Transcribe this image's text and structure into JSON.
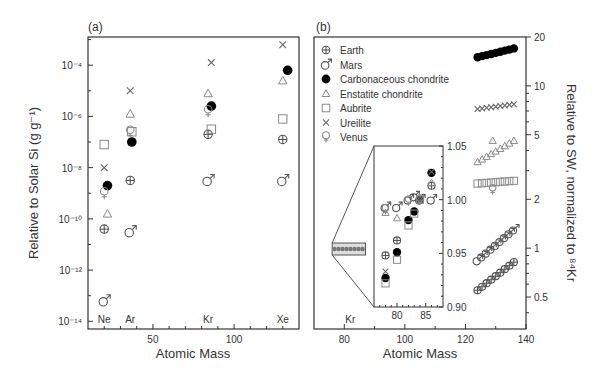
{
  "figure": {
    "panel_a_label": "(a)",
    "panel_b_label": "(b)"
  },
  "chart_data": [
    {
      "type": "scatter",
      "panel": "(a)",
      "title": "",
      "xlabel": "Atomic Mass",
      "ylabel": "Relative to Solar Si (g g⁻¹)",
      "xlim": [
        10,
        140
      ],
      "ylim_log10": [
        -14.3,
        -2.9
      ],
      "yscale": "log",
      "x_ticks": [
        50,
        100
      ],
      "y_ticks": [
        "10⁻¹⁴",
        "10⁻¹²",
        "10⁻¹⁰",
        "10⁻⁸",
        "10⁻⁶",
        "10⁻⁴"
      ],
      "element_labels": [
        {
          "text": "Ne",
          "x": 20
        },
        {
          "text": "Ar",
          "x": 36
        },
        {
          "text": "Kr",
          "x": 84
        },
        {
          "text": "Xe",
          "x": 130
        }
      ],
      "grid": false,
      "series": [
        {
          "name": "Earth",
          "marker": "earth",
          "points": [
            [
              20,
              -10.4
            ],
            [
              36,
              -8.5
            ],
            [
              84,
              -6.7
            ],
            [
              130,
              -6.9
            ]
          ]
        },
        {
          "name": "Mars",
          "marker": "mars",
          "points": [
            [
              20,
              -13.2
            ],
            [
              36,
              -10.5
            ],
            [
              84,
              -8.5
            ],
            [
              130,
              -8.5
            ]
          ]
        },
        {
          "name": "Carbonaceous chondrite",
          "marker": "filled-circle",
          "points": [
            [
              22,
              -8.7
            ],
            [
              37,
              -7.0
            ],
            [
              86,
              -5.6
            ],
            [
              133,
              -4.2
            ]
          ]
        },
        {
          "name": "Enstatite chondrite",
          "marker": "triangle",
          "points": [
            [
              22,
              -9.8
            ],
            [
              36,
              -5.9
            ],
            [
              84,
              -5.1
            ],
            [
              130,
              -4.6
            ]
          ]
        },
        {
          "name": "Aubrite",
          "marker": "square",
          "points": [
            [
              20,
              -7.1
            ],
            [
              37,
              -6.6
            ],
            [
              86,
              -6.5
            ],
            [
              130,
              -6.1
            ]
          ]
        },
        {
          "name": "Ureilite",
          "marker": "cross",
          "points": [
            [
              20,
              -8.0
            ],
            [
              36,
              -5.0
            ],
            [
              86,
              -3.9
            ],
            [
              130,
              -3.2
            ]
          ]
        },
        {
          "name": "Venus",
          "marker": "venus",
          "points": [
            [
              20,
              -9.0
            ],
            [
              36,
              -6.6
            ],
            [
              84,
              -5.8
            ]
          ]
        }
      ]
    },
    {
      "type": "scatter",
      "panel": "(b)",
      "title": "",
      "xlabel": "Atomic Mass",
      "ylabel": "Relative to SW, normalized to ⁸⁴Kr",
      "ylabel_position": "right",
      "xlim": [
        70,
        140
      ],
      "ylim": [
        0.3,
        20
      ],
      "yscale": "log",
      "x_ticks": [
        80,
        100,
        120,
        140
      ],
      "y_ticks": [
        0.5,
        1,
        2,
        5,
        10,
        20
      ],
      "element_labels": [
        {
          "text": "Kr",
          "x": 82
        }
      ],
      "grid": false,
      "legend": {
        "position": "upper left",
        "entries": [
          "Earth",
          "Mars",
          "Carbonaceous chondrite",
          "Enstatite chondrite",
          "Aubrite",
          "Ureilite",
          "Venus"
        ]
      },
      "series": [
        {
          "name": "Earth",
          "marker": "earth",
          "x_range": [
            124,
            136
          ],
          "y_range": [
            0.55,
            0.82
          ],
          "note": "Xe isotopes, rising trend"
        },
        {
          "name": "Mars",
          "marker": "mars",
          "x_range": [
            124,
            136
          ],
          "y_range": [
            0.84,
            1.3
          ],
          "note": "Xe isotopes, rising trend"
        },
        {
          "name": "Carbonaceous chondrite",
          "marker": "filled-circle",
          "x_range": [
            124,
            136
          ],
          "y_range": [
            15,
            17
          ],
          "note": "Xe isotopes"
        },
        {
          "name": "Enstatite chondrite",
          "marker": "triangle",
          "x_range": [
            124,
            136
          ],
          "y_range": [
            3.4,
            4.6
          ],
          "note": "Xe isotopes"
        },
        {
          "name": "Aubrite",
          "marker": "square",
          "x_range": [
            124,
            136
          ],
          "y_range": [
            2.5,
            2.6
          ],
          "note": "Xe isotopes"
        },
        {
          "name": "Ureilite",
          "marker": "cross",
          "x_range": [
            124,
            136
          ],
          "y_range": [
            7.2,
            7.7
          ],
          "note": "Xe isotopes"
        },
        {
          "name": "Venus",
          "marker": "venus",
          "x_range": [
            129,
            129
          ],
          "y_range": [
            2.3,
            2.3
          ]
        }
      ],
      "inset": {
        "xlim": [
          76,
          88
        ],
        "ylim": [
          0.9,
          1.05
        ],
        "x_ticks": [
          80,
          85
        ],
        "y_ticks": [
          0.9,
          0.95,
          1.0,
          1.05
        ],
        "series": [
          {
            "name": "Earth",
            "marker": "earth",
            "points": [
              [
                78,
                0.948
              ],
              [
                80,
                0.962
              ],
              [
                86,
                1.013
              ]
            ]
          },
          {
            "name": "Mars",
            "marker": "mars",
            "points": [
              [
                78,
                0.993
              ],
              [
                80,
                0.993
              ],
              [
                82,
                1.0
              ],
              [
                83,
                1.003
              ],
              [
                84,
                1.0
              ],
              [
                86,
                1.0
              ]
            ]
          },
          {
            "name": "Carbonaceous chondrite",
            "marker": "filled-circle",
            "points": [
              [
                78,
                0.927
              ],
              [
                80,
                0.951
              ],
              [
                82,
                0.981
              ],
              [
                83,
                0.989
              ],
              [
                84,
                1.0
              ],
              [
                86,
                1.025
              ]
            ]
          },
          {
            "name": "Enstatite chondrite",
            "marker": "triangle",
            "points": [
              [
                78,
                0.988
              ],
              [
                80,
                0.983
              ],
              [
                84,
                1.0
              ],
              [
                86,
                1.016
              ]
            ]
          },
          {
            "name": "Aubrite",
            "marker": "square",
            "points": [
              [
                78,
                0.922
              ],
              [
                80,
                0.944
              ],
              [
                82,
                0.976
              ],
              [
                83,
                0.987
              ],
              [
                84,
                1.0
              ]
            ]
          },
          {
            "name": "Ureilite",
            "marker": "cross",
            "points": [
              [
                78,
                0.933
              ],
              [
                84,
                1.0
              ],
              [
                86,
                1.026
              ]
            ]
          },
          {
            "name": "Venus",
            "marker": "venus",
            "points": [
              [
                78,
                0.991
              ],
              [
                82,
                0.999
              ],
              [
                84,
                1.0
              ]
            ]
          }
        ]
      }
    }
  ],
  "axes": {
    "a": {
      "xlabel": "Atomic Mass",
      "ylabel": "Relative to Solar Si (g g⁻¹)",
      "xticks": [
        {
          "v": 50,
          "label": "50"
        },
        {
          "v": 100,
          "label": "100"
        }
      ],
      "yticks": [
        {
          "e": -4,
          "label": "10⁻⁴"
        },
        {
          "e": -6,
          "label": "10⁻⁶"
        },
        {
          "e": -8,
          "label": "10⁻⁸"
        },
        {
          "e": -10,
          "label": "10⁻¹⁰"
        },
        {
          "e": -12,
          "label": "10⁻¹²"
        },
        {
          "e": -14,
          "label": "10⁻¹⁴"
        }
      ]
    },
    "b": {
      "xlabel": "Atomic Mass",
      "ylabel": "Relative to SW, normalized to ⁸⁴Kr",
      "xticks": [
        {
          "v": 80,
          "label": "80"
        },
        {
          "v": 100,
          "label": "100"
        },
        {
          "v": 120,
          "label": "120"
        },
        {
          "v": 140,
          "label": "140"
        }
      ],
      "yticks": [
        {
          "v": 0.5,
          "label": "0.5"
        },
        {
          "v": 1,
          "label": "1"
        },
        {
          "v": 2,
          "label": "2"
        },
        {
          "v": 5,
          "label": "5"
        },
        {
          "v": 10,
          "label": "10"
        },
        {
          "v": 20,
          "label": "20"
        }
      ],
      "inset_xticks": [
        {
          "v": 80,
          "label": "80"
        },
        {
          "v": 85,
          "label": "85"
        }
      ],
      "inset_yticks": [
        {
          "v": 0.9,
          "label": "0.90"
        },
        {
          "v": 0.95,
          "label": "0.95"
        },
        {
          "v": 1.0,
          "label": "1.00"
        },
        {
          "v": 1.05,
          "label": "1.05"
        }
      ]
    }
  },
  "legend": [
    {
      "label": "Earth",
      "marker": "earth"
    },
    {
      "label": "Mars",
      "marker": "mars"
    },
    {
      "label": "Carbonaceous chondrite",
      "marker": "filled-circle"
    },
    {
      "label": "Enstatite chondrite",
      "marker": "triangle"
    },
    {
      "label": "Aubrite",
      "marker": "square"
    },
    {
      "label": "Ureilite",
      "marker": "cross"
    },
    {
      "label": "Venus",
      "marker": "venus"
    }
  ],
  "colors": {
    "axis": "#333333",
    "dark_marker": "#555555",
    "light_marker": "#8a8a8a",
    "filled": "#000000"
  }
}
